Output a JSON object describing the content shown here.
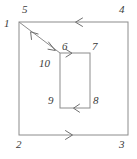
{
  "figure": {
    "kind": "contour-diagram",
    "background_color": "#ffffff",
    "stroke_color": "#8c8c8c",
    "label_color": "#3a3a3a",
    "outer_square": {
      "name": "outer-square",
      "x1": 19,
      "y1": 22,
      "x2": 128,
      "y2": 135
    },
    "inner_rectangle": {
      "name": "inner-rectangle",
      "x1": 60,
      "y1": 53,
      "x2": 90,
      "y2": 108
    },
    "cut_line": {
      "name": "diagonal-cut-line",
      "from_x": 19,
      "from_y": 22,
      "to_x": 60,
      "to_y": 53,
      "arrowheads": [
        "up-left",
        "down-right"
      ]
    },
    "direction_arrows": [
      {
        "name": "outer-top-arrow",
        "edge": "outer-top",
        "direction": "left",
        "x": 78,
        "y": 22
      },
      {
        "name": "outer-bottom-arrow",
        "edge": "outer-bottom",
        "direction": "right",
        "x": 70,
        "y": 135
      },
      {
        "name": "inner-top-arrow",
        "edge": "inner-top",
        "direction": "right",
        "x": 70,
        "y": 53
      },
      {
        "name": "inner-bottom-arrow",
        "edge": "inner-bottom",
        "direction": "left",
        "x": 76,
        "y": 108
      }
    ],
    "labels": [
      {
        "name": "label-1",
        "text": "1",
        "x": 4,
        "y": 18
      },
      {
        "name": "label-5",
        "text": "5",
        "x": 22,
        "y": 4
      },
      {
        "name": "label-4",
        "text": "4",
        "x": 119,
        "y": 4
      },
      {
        "name": "label-2",
        "text": "2",
        "x": 16,
        "y": 139
      },
      {
        "name": "label-3",
        "text": "3",
        "x": 119,
        "y": 139
      },
      {
        "name": "label-6",
        "text": "6",
        "x": 62,
        "y": 41
      },
      {
        "name": "label-7",
        "text": "7",
        "x": 92,
        "y": 41
      },
      {
        "name": "label-10",
        "text": "10",
        "x": 39,
        "y": 58
      },
      {
        "name": "label-9",
        "text": "9",
        "x": 48,
        "y": 95
      },
      {
        "name": "label-8",
        "text": "8",
        "x": 93,
        "y": 95
      }
    ]
  }
}
